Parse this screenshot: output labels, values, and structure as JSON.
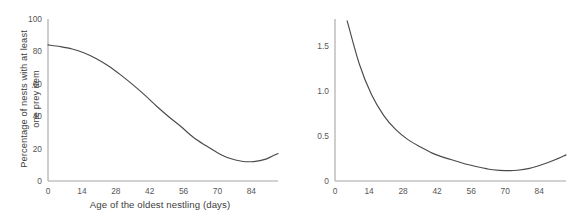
{
  "figure": {
    "background": "#ffffff",
    "curve_color": "#4a4a4a",
    "axis_color": "#a6a6a6",
    "tick_text_color": "#575757",
    "label_color": "#3d3d3d"
  },
  "chart_data": [
    {
      "id": "left",
      "type": "line",
      "title": "",
      "xlabel": "Age of the oldest nestling (days)",
      "ylabel": "Percentage of nests with at least\none prey item",
      "ylabel_line1": "Percentage of nests with at least",
      "ylabel_line2": "one prey item",
      "xlim": [
        0,
        95
      ],
      "ylim": [
        0,
        100
      ],
      "xticks": [
        0,
        14,
        28,
        42,
        56,
        70,
        84
      ],
      "xticklabels": [
        "0",
        "14",
        "28",
        "42",
        "56",
        "70",
        "84"
      ],
      "yticks": [
        0,
        20,
        40,
        60,
        80,
        100
      ],
      "yticklabels": [
        "0",
        "20",
        "40",
        "60",
        "80",
        "100"
      ],
      "grid": false,
      "legend": "none",
      "series": [
        {
          "name": "Percentage of nests with at least one prey item",
          "color": "#4a4a4a",
          "x": [
            0,
            5,
            10,
            15,
            20,
            25,
            30,
            35,
            40,
            45,
            50,
            55,
            60,
            65,
            70,
            75,
            80,
            85,
            90,
            95
          ],
          "values": [
            84,
            83,
            81.5,
            79,
            75.5,
            71,
            65.5,
            59.5,
            53,
            46,
            39.5,
            33.5,
            27,
            22,
            17.5,
            14,
            12.2,
            12,
            13.5,
            17
          ]
        }
      ]
    },
    {
      "id": "right",
      "type": "line",
      "title": "",
      "xlabel": "Age of the oldest nestling (days)",
      "ylabel": "Mean number of prey remains\nper nest per nestling",
      "ylabel_line1": "Mean number of prey remains",
      "ylabel_line2": "per nest per nestling",
      "xlim": [
        0,
        95
      ],
      "ylim": [
        0,
        1.8
      ],
      "xticks": [
        0,
        14,
        28,
        42,
        56,
        70,
        84
      ],
      "xticklabels": [
        "0",
        "14",
        "28",
        "42",
        "56",
        "70",
        "84"
      ],
      "yticks": [
        0,
        0.5,
        1.0,
        1.5
      ],
      "yticklabels": [
        "0",
        "0.5",
        "1.0",
        "1.5"
      ],
      "grid": false,
      "legend": "none",
      "series": [
        {
          "name": "Mean number of prey remains per nest per nestling",
          "color": "#4a4a4a",
          "x": [
            5,
            10,
            15,
            20,
            25,
            30,
            35,
            40,
            45,
            50,
            55,
            60,
            65,
            70,
            75,
            80,
            85,
            90,
            95
          ],
          "values": [
            1.78,
            1.3,
            0.96,
            0.73,
            0.57,
            0.46,
            0.38,
            0.31,
            0.26,
            0.22,
            0.18,
            0.15,
            0.125,
            0.115,
            0.12,
            0.14,
            0.18,
            0.23,
            0.29
          ]
        }
      ]
    }
  ]
}
